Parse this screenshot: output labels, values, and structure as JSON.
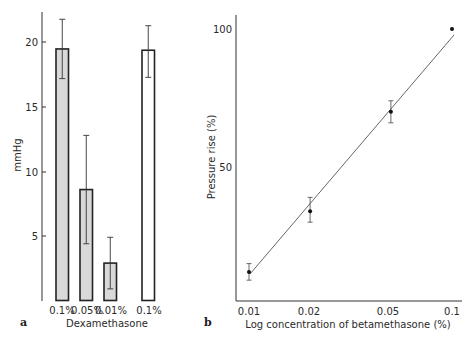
{
  "chart_data": [
    {
      "panel": "a",
      "type": "bar",
      "title": "",
      "xlabel": "Dexamethasone",
      "ylabel": "mmHg",
      "ylim": [
        0,
        22
      ],
      "yticks": [
        5,
        10,
        15,
        20
      ],
      "categories": [
        "0.1%",
        "0.05%",
        "0.01%",
        "0.1%"
      ],
      "values": [
        19.5,
        8.6,
        2.9,
        19.4
      ],
      "error_low": [
        17.2,
        4.4,
        0.9,
        17.3
      ],
      "error_high": [
        21.8,
        12.8,
        4.9,
        21.3
      ],
      "bar_fill": [
        "#d9d9d9",
        "#d9d9d9",
        "#d9d9d9",
        "#ffffff"
      ],
      "grid": false
    },
    {
      "panel": "b",
      "type": "line",
      "title": "",
      "xlabel": "Log concentration of betamethasone (%)",
      "ylabel": "Pressure rise (%)",
      "xscale": "log",
      "xticks": [
        "0.01",
        "0.02",
        "0.05",
        "0.1"
      ],
      "yticks": [
        50,
        100
      ],
      "x": [
        0.01,
        0.02,
        0.05,
        0.1
      ],
      "series": [
        {
          "name": "measured",
          "values": [
            12,
            34,
            70,
            100
          ],
          "error_low": [
            9,
            30,
            66,
            null
          ],
          "error_high": [
            15,
            39,
            74,
            null
          ]
        },
        {
          "name": "regression line",
          "x": [
            0.01,
            0.1
          ],
          "values": [
            11,
            98
          ]
        }
      ],
      "grid": false
    }
  ],
  "panel_a": {
    "label": "a",
    "ylabel": "mmHg",
    "xlabel": "Dexamethasone",
    "yticks": [
      "5",
      "10",
      "15",
      "20"
    ],
    "categories": [
      "0.1%",
      "0.05%",
      "0.01%",
      "0.1%"
    ]
  },
  "panel_b": {
    "label": "b",
    "ylabel": "Pressure rise (%)",
    "xlabel": "Log concentration of betamethasone (%)",
    "yticks": [
      "50",
      "100"
    ],
    "xticks": [
      "0.01",
      "0.02",
      "0.05",
      "0.1"
    ]
  }
}
